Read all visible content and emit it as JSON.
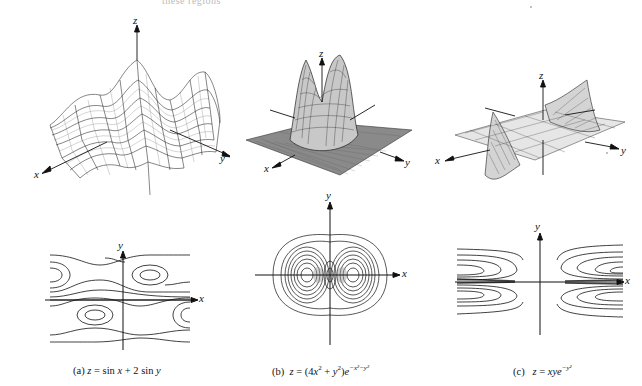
{
  "page": {
    "top_fragment": "these regions"
  },
  "figures": [
    {
      "id": "a",
      "caption_prefix": "(a)",
      "caption_formula": "z = sin x + 2 sin y",
      "surface_axes": {
        "x": "x",
        "y": "y",
        "z": "z"
      },
      "contour_axes": {
        "x": "x",
        "y": "y"
      }
    },
    {
      "id": "b",
      "caption_prefix": "(b)",
      "caption_formula": "z = (4x² + y²)e^(−x²−y²)",
      "surface_axes": {
        "x": "x",
        "y": "y",
        "z": "z"
      },
      "contour_axes": {
        "x": "x",
        "y": "y"
      }
    },
    {
      "id": "c",
      "caption_prefix": "(c)",
      "caption_formula": "z = xye^(−y²)",
      "surface_axes": {
        "x": "x",
        "y": "y",
        "z": "z"
      },
      "contour_axes": {
        "x": "x",
        "y": "y"
      }
    }
  ],
  "captions": {
    "a_label": "(a)",
    "a_z": "z",
    "a_eq": " = sin ",
    "a_x": "x",
    "a_plus": " + 2 sin ",
    "a_y": "y",
    "b_label": "(b)",
    "b_z": "z",
    "b_eq": " = (4",
    "b_x": "x",
    "b_sq1": "2",
    "b_plus": " + ",
    "b_y": "y",
    "b_sq2": "2",
    "b_close": ")",
    "b_e": "e",
    "b_exp": "−x²−y²",
    "c_label": "(c)",
    "c_z": "z",
    "c_eq": " = ",
    "c_xy": "xye",
    "c_exp": "−y²"
  },
  "axes_labels": {
    "x": "x",
    "y": "y",
    "z": "z"
  }
}
